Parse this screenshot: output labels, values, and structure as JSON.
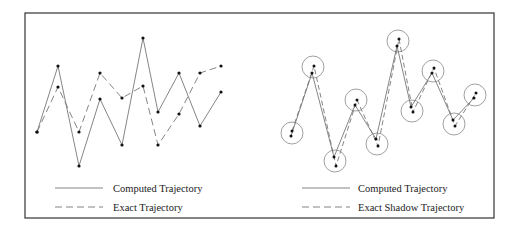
{
  "figure": {
    "frame": {
      "x": 25,
      "y": 13,
      "width": 469,
      "height": 205,
      "stroke": "#333333"
    },
    "colors": {
      "line": "#777777",
      "point": "#111111",
      "circle": "#888888"
    },
    "left_panel": {
      "computed_trajectory": [
        [
          37,
          132
        ],
        [
          58,
          66
        ],
        [
          79,
          166
        ],
        [
          100,
          99
        ],
        [
          122,
          145
        ],
        [
          143,
          38
        ],
        [
          158,
          112
        ],
        [
          179,
          73
        ],
        [
          200,
          126
        ],
        [
          221,
          92
        ]
      ],
      "exact_trajectory": [
        [
          37,
          132
        ],
        [
          58,
          87
        ],
        [
          79,
          132
        ],
        [
          100,
          73
        ],
        [
          122,
          98
        ],
        [
          143,
          86
        ],
        [
          158,
          145
        ],
        [
          179,
          114
        ],
        [
          200,
          73
        ],
        [
          221,
          66
        ]
      ],
      "legend": [
        {
          "style": "solid",
          "label": "Computed Trajectory"
        },
        {
          "style": "dashed",
          "label": "Exact Trajectory"
        }
      ]
    },
    "right_panel": {
      "circle_radius": 11,
      "circles": [
        [
          292,
          133
        ],
        [
          313,
          67
        ],
        [
          335,
          161
        ],
        [
          356,
          100
        ],
        [
          377,
          144
        ],
        [
          398,
          41
        ],
        [
          412,
          111
        ],
        [
          433,
          71
        ],
        [
          454,
          124
        ],
        [
          475,
          95
        ]
      ],
      "computed_trajectory": [
        [
          291,
          136
        ],
        [
          312,
          73
        ],
        [
          334,
          157
        ],
        [
          355,
          105
        ],
        [
          376,
          139
        ],
        [
          397,
          46
        ],
        [
          411,
          107
        ],
        [
          432,
          73
        ],
        [
          453,
          120
        ],
        [
          474,
          98
        ]
      ],
      "exact_shadow_trajectory": [
        [
          292,
          131
        ],
        [
          314,
          66
        ],
        [
          336,
          166
        ],
        [
          357,
          100
        ],
        [
          378,
          146
        ],
        [
          399,
          39
        ],
        [
          413,
          112
        ],
        [
          434,
          68
        ],
        [
          455,
          126
        ],
        [
          476,
          93
        ]
      ],
      "legend": [
        {
          "style": "solid",
          "label": "Computed Trajectory"
        },
        {
          "style": "dashed",
          "label": "Exact Shadow Trajectory"
        }
      ]
    }
  }
}
